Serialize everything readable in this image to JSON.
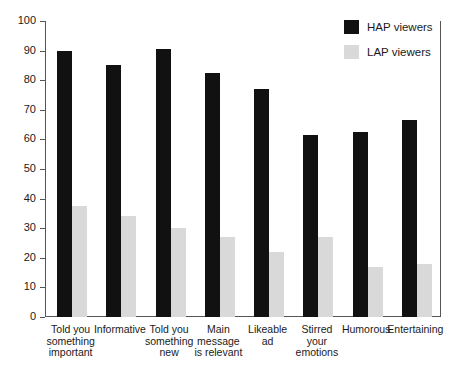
{
  "chart_data": {
    "type": "bar",
    "title": "",
    "subtitle": "",
    "xlabel": "",
    "ylabel": "",
    "ylim": [
      0,
      100
    ],
    "yticks": [
      0,
      10,
      20,
      30,
      40,
      50,
      60,
      70,
      80,
      90,
      100
    ],
    "grid": false,
    "legend_position": "top-right",
    "categories": [
      "Told you something important",
      "Informative",
      "Told you something new",
      "Main message is relevant",
      "Likeable ad",
      "Stirred your emotions",
      "Humorous",
      "Entertaining"
    ],
    "category_lines": [
      [
        "Told you",
        "something",
        "important"
      ],
      [
        "Informative"
      ],
      [
        "Told you",
        "something",
        "new"
      ],
      [
        "Main",
        "message",
        "is relevant"
      ],
      [
        "Likeable",
        "ad"
      ],
      [
        "Stirred",
        "your",
        "emotions"
      ],
      [
        "Humorous"
      ],
      [
        "Entertaining"
      ]
    ],
    "series": [
      {
        "name": "HAP viewers",
        "color": "#111111",
        "values": [
          90,
          85,
          90.5,
          82.5,
          77,
          61.5,
          62.5,
          66.5
        ]
      },
      {
        "name": "LAP viewers",
        "color": "#d9d9d9",
        "values": [
          37.5,
          34,
          30,
          27,
          22,
          27,
          17,
          18
        ]
      }
    ]
  },
  "legend": {
    "entries": [
      {
        "label": "HAP viewers",
        "color": "#111111"
      },
      {
        "label": "LAP viewers",
        "color": "#d9d9d9"
      }
    ]
  },
  "axis": {
    "y_tick_labels": [
      "100",
      "90",
      "80",
      "70",
      "60",
      "50",
      "40",
      "30",
      "20",
      "10",
      "0"
    ],
    "axis_color": "#555555"
  }
}
